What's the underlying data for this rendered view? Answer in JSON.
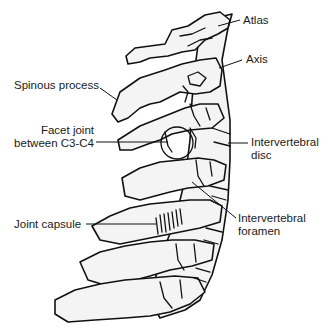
{
  "figure": {
    "labels": {
      "atlas": "Atlas",
      "axis": "Axis",
      "spinous_process": "Spinous process",
      "facet_joint_line1": "Facet joint",
      "facet_joint_line2": "between C3-C4",
      "intervertebral_disc_line1": "Intervertebral",
      "intervertebral_disc_line2": "disc",
      "joint_capsule": "Joint capsule",
      "intervertebral_foramen_line1": "Intervertebral",
      "intervertebral_foramen_line2": "foramen"
    },
    "colors": {
      "outline": "#111111",
      "bone_fill": "#f4f4f4",
      "background": "#ffffff",
      "text": "#1a1a1a"
    }
  }
}
